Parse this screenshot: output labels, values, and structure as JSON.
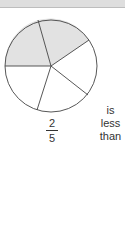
{
  "figure": {
    "pie": {
      "total_slices": 5,
      "shaded_slices": 2,
      "shade_color": "#e2e2e2",
      "stroke_color": "#444444"
    },
    "fraction": {
      "numerator": "2",
      "denominator": "5"
    },
    "caption_words": [
      "is",
      "less",
      "than"
    ]
  }
}
